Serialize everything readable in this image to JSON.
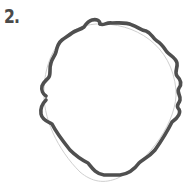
{
  "step": {
    "label": "2."
  },
  "drawing": {
    "subject": "head-outline-with-curly-hair",
    "stroke_color": "#4f4f4f",
    "guide_color": "#c8c8c8",
    "background": "#ffffff"
  }
}
